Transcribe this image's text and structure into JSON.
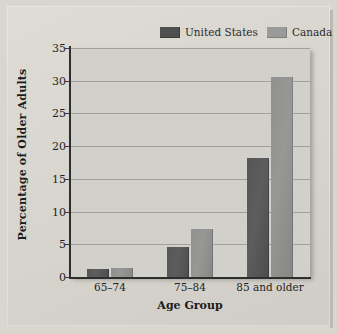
{
  "chart_data": {
    "type": "bar",
    "title": "",
    "xlabel": "Age Group",
    "ylabel": "Percentage of Older Adults",
    "categories": [
      "65–74",
      "75–84",
      "85 and older"
    ],
    "series": [
      {
        "name": "United States",
        "color": "#555555",
        "values": [
          1.2,
          4.6,
          18.2
        ]
      },
      {
        "name": "Canada",
        "color": "#939392",
        "values": [
          1.4,
          7.4,
          30.6
        ]
      }
    ],
    "ylim": [
      0,
      35
    ],
    "yticks": [
      0,
      5,
      10,
      15,
      20,
      25,
      30,
      35
    ],
    "ytick_labels": [
      "0",
      "5",
      "10",
      "15",
      "20",
      "25",
      "30",
      "35"
    ],
    "grid": true,
    "grid_axis": "y",
    "legend_position": "top-right"
  },
  "legend": {
    "items": [
      {
        "label": "United States",
        "swatch": "us"
      },
      {
        "label": "Canada",
        "swatch": "ca"
      }
    ]
  },
  "axes": {
    "x_title": "Age Group",
    "y_title": "Percentage of Older Adults"
  },
  "colors": {
    "page_background": "#d8d6cf",
    "plot_background": "#d2d0ca",
    "gridline": "#7a7872",
    "axis": "#2e2e2e",
    "united_states": "#555555",
    "canada": "#939392"
  }
}
